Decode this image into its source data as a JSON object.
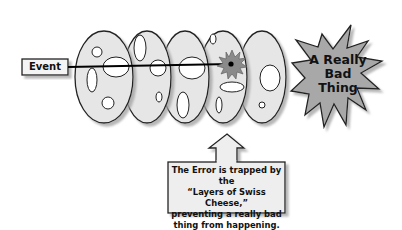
{
  "diagram": {
    "type": "swiss-cheese-model",
    "event": {
      "label": "Event"
    },
    "outcome": {
      "label_lines": [
        "A Really",
        "Bad",
        "Thing"
      ]
    },
    "callout": {
      "lines": [
        "The Error is trapped by the",
        "“Layers of Swiss Cheese,”",
        "preventing a really bad",
        "thing from happening."
      ]
    },
    "layers": [
      {
        "name": "layer-1"
      },
      {
        "name": "layer-2"
      },
      {
        "name": "layer-3"
      },
      {
        "name": "layer-4"
      },
      {
        "name": "layer-5"
      }
    ],
    "colors": {
      "slice_fill": "#e6e6e6",
      "slice_stroke": "#222222",
      "shadow": "#9a9a9a",
      "burst_fill": "#a8a8a8",
      "box_fill": "#eeeeee",
      "line": "#000000"
    }
  }
}
